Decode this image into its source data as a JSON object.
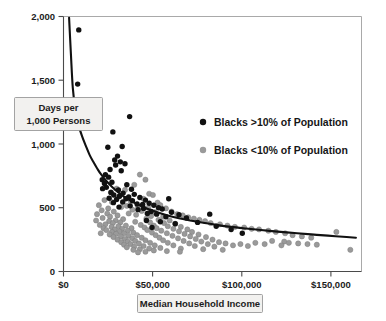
{
  "chart_data": {
    "type": "scatter",
    "title": "",
    "xlabel": "Median Household Income",
    "ylabel": "Days per 1,000 Persons",
    "ylabel_line1": "Days per",
    "ylabel_line2": "1,000 Persons",
    "xlim": [
      0,
      160000
    ],
    "ylim": [
      0,
      2000
    ],
    "grid": false,
    "legend_position": "inside-upper-right",
    "xticks": [
      0,
      50000,
      100000,
      150000
    ],
    "xtick_labels": [
      "$0",
      "$50,000",
      "$100,000",
      "$150,000"
    ],
    "yticks": [
      0,
      500,
      1000,
      1500,
      2000
    ],
    "ytick_labels": [
      "0",
      "500",
      "1,000",
      "1,500",
      "2,000"
    ],
    "colors": {
      "series_black": "#111111",
      "series_gray": "#9a9a9a",
      "curve": "#111111",
      "axis": "#4a4a4a",
      "frame": "#a9a9a9",
      "callout_fill": "#f2f1ef",
      "callout_stroke": "#8d8d8d",
      "background": "#ffffff"
    },
    "series": [
      {
        "name": "Blacks >10% of Population",
        "marker": "filled-circle",
        "color": "#111111",
        "points": [
          [
            8200,
            1895
          ],
          [
            7600,
            1470
          ],
          [
            35500,
            1215
          ],
          [
            26500,
            1095
          ],
          [
            23800,
            975
          ],
          [
            31500,
            980
          ],
          [
            29000,
            905
          ],
          [
            27500,
            875
          ],
          [
            30500,
            860
          ],
          [
            33000,
            845
          ],
          [
            28000,
            835
          ],
          [
            25000,
            800
          ],
          [
            31000,
            790
          ],
          [
            22500,
            760
          ],
          [
            24200,
            740
          ],
          [
            20800,
            720
          ],
          [
            26000,
            700
          ],
          [
            22000,
            690
          ],
          [
            34000,
            680
          ],
          [
            23000,
            660
          ],
          [
            21000,
            650
          ],
          [
            29500,
            640
          ],
          [
            36500,
            645
          ],
          [
            25500,
            620
          ],
          [
            32000,
            615
          ],
          [
            27000,
            600
          ],
          [
            38000,
            605
          ],
          [
            30000,
            590
          ],
          [
            35000,
            585
          ],
          [
            24500,
            575
          ],
          [
            41000,
            580
          ],
          [
            33500,
            570
          ],
          [
            28500,
            565
          ],
          [
            44000,
            560
          ],
          [
            37000,
            555
          ],
          [
            56500,
            570
          ],
          [
            31800,
            545
          ],
          [
            26800,
            540
          ],
          [
            46000,
            535
          ],
          [
            39500,
            530
          ],
          [
            42500,
            525
          ],
          [
            48500,
            520
          ],
          [
            35800,
            515
          ],
          [
            29800,
            505
          ],
          [
            51000,
            500
          ],
          [
            43000,
            495
          ],
          [
            53000,
            490
          ],
          [
            40000,
            485
          ],
          [
            47000,
            470
          ],
          [
            58000,
            465
          ],
          [
            45000,
            455
          ],
          [
            50000,
            450
          ],
          [
            62000,
            445
          ],
          [
            55000,
            430
          ],
          [
            78500,
            450
          ],
          [
            66000,
            420
          ],
          [
            44500,
            400
          ],
          [
            52000,
            390
          ],
          [
            72000,
            385
          ],
          [
            60000,
            375
          ],
          [
            47500,
            345
          ],
          [
            82000,
            355
          ],
          [
            90000,
            330
          ],
          [
            96000,
            300
          ]
        ]
      },
      {
        "name": "Blacks <10% of Population",
        "marker": "filled-circle",
        "color": "#9a9a9a",
        "points": [
          [
            41000,
            760
          ],
          [
            44000,
            720
          ],
          [
            38000,
            680
          ],
          [
            28500,
            650
          ],
          [
            25500,
            620
          ],
          [
            33000,
            640
          ],
          [
            46000,
            610
          ],
          [
            48000,
            600
          ],
          [
            30000,
            590
          ],
          [
            22000,
            560
          ],
          [
            19000,
            520
          ],
          [
            26000,
            545
          ],
          [
            36000,
            555
          ],
          [
            43000,
            570
          ],
          [
            50500,
            540
          ],
          [
            52000,
            520
          ],
          [
            34000,
            515
          ],
          [
            31000,
            505
          ],
          [
            24000,
            495
          ],
          [
            20500,
            480
          ],
          [
            40000,
            510
          ],
          [
            45500,
            500
          ],
          [
            55000,
            495
          ],
          [
            58000,
            470
          ],
          [
            27000,
            470
          ],
          [
            23500,
            455
          ],
          [
            18000,
            450
          ],
          [
            37000,
            485
          ],
          [
            42000,
            475
          ],
          [
            49000,
            465
          ],
          [
            61000,
            450
          ],
          [
            64000,
            440
          ],
          [
            29000,
            440
          ],
          [
            25000,
            430
          ],
          [
            21000,
            420
          ],
          [
            35000,
            455
          ],
          [
            39000,
            445
          ],
          [
            47000,
            435
          ],
          [
            53500,
            430
          ],
          [
            67000,
            425
          ],
          [
            70000,
            415
          ],
          [
            32000,
            410
          ],
          [
            28000,
            400
          ],
          [
            24500,
            395
          ],
          [
            17500,
            400
          ],
          [
            44500,
            415
          ],
          [
            51000,
            405
          ],
          [
            57000,
            400
          ],
          [
            73000,
            405
          ],
          [
            76000,
            395
          ],
          [
            30500,
            385
          ],
          [
            26500,
            380
          ],
          [
            22500,
            370
          ],
          [
            19500,
            365
          ],
          [
            38500,
            390
          ],
          [
            46500,
            385
          ],
          [
            54000,
            380
          ],
          [
            60000,
            375
          ],
          [
            79000,
            380
          ],
          [
            84000,
            370
          ],
          [
            33500,
            360
          ],
          [
            29500,
            355
          ],
          [
            25800,
            350
          ],
          [
            21500,
            340
          ],
          [
            41500,
            365
          ],
          [
            48500,
            360
          ],
          [
            56000,
            355
          ],
          [
            63000,
            350
          ],
          [
            88000,
            360
          ],
          [
            92000,
            350
          ],
          [
            36500,
            340
          ],
          [
            31500,
            335
          ],
          [
            27500,
            330
          ],
          [
            23000,
            325
          ],
          [
            43500,
            345
          ],
          [
            50000,
            340
          ],
          [
            59000,
            335
          ],
          [
            66500,
            330
          ],
          [
            97000,
            345
          ],
          [
            101000,
            335
          ],
          [
            34500,
            320
          ],
          [
            30000,
            315
          ],
          [
            26000,
            310
          ],
          [
            20000,
            300
          ],
          [
            45000,
            325
          ],
          [
            52500,
            320
          ],
          [
            62000,
            315
          ],
          [
            69000,
            310
          ],
          [
            105000,
            330
          ],
          [
            110000,
            320
          ],
          [
            37500,
            305
          ],
          [
            32500,
            300
          ],
          [
            28200,
            295
          ],
          [
            24800,
            290
          ],
          [
            47500,
            305
          ],
          [
            55500,
            300
          ],
          [
            65000,
            295
          ],
          [
            72500,
            290
          ],
          [
            114000,
            310
          ],
          [
            119000,
            300
          ],
          [
            39500,
            285
          ],
          [
            35000,
            280
          ],
          [
            30800,
            275
          ],
          [
            26800,
            270
          ],
          [
            49500,
            285
          ],
          [
            58500,
            280
          ],
          [
            68000,
            275
          ],
          [
            76500,
            270
          ],
          [
            123000,
            285
          ],
          [
            128000,
            275
          ],
          [
            42000,
            265
          ],
          [
            37000,
            260
          ],
          [
            33000,
            255
          ],
          [
            29000,
            250
          ],
          [
            51500,
            265
          ],
          [
            61500,
            260
          ],
          [
            71000,
            255
          ],
          [
            80000,
            250
          ],
          [
            133000,
            265
          ],
          [
            146500,
            310
          ],
          [
            44000,
            245
          ],
          [
            38500,
            240
          ],
          [
            34500,
            235
          ],
          [
            31000,
            230
          ],
          [
            53500,
            245
          ],
          [
            64500,
            240
          ],
          [
            74000,
            235
          ],
          [
            83500,
            230
          ],
          [
            112000,
            240
          ],
          [
            118500,
            235
          ],
          [
            46500,
            225
          ],
          [
            40500,
            220
          ],
          [
            36000,
            215
          ],
          [
            32500,
            210
          ],
          [
            56000,
            225
          ],
          [
            67500,
            220
          ],
          [
            77500,
            215
          ],
          [
            87000,
            220
          ],
          [
            95000,
            215
          ],
          [
            103000,
            225
          ],
          [
            108000,
            215
          ],
          [
            121000,
            225
          ],
          [
            126000,
            220
          ],
          [
            131000,
            215
          ],
          [
            49000,
            205
          ],
          [
            43000,
            200
          ],
          [
            38000,
            195
          ],
          [
            34000,
            190
          ],
          [
            59000,
            205
          ],
          [
            70500,
            200
          ],
          [
            81000,
            195
          ],
          [
            91000,
            205
          ],
          [
            99000,
            200
          ],
          [
            117000,
            205
          ],
          [
            136000,
            210
          ],
          [
            154000,
            170
          ],
          [
            52000,
            185
          ],
          [
            46000,
            180
          ],
          [
            41000,
            175
          ],
          [
            37500,
            170
          ],
          [
            63000,
            180
          ],
          [
            75000,
            175
          ],
          [
            85500,
            170
          ],
          [
            62500,
            155
          ],
          [
            55500,
            160
          ],
          [
            48500,
            165
          ],
          [
            44000,
            155
          ],
          [
            40000,
            150
          ]
        ]
      }
    ],
    "fit_curve": {
      "description": "power-law decay trend line",
      "points": [
        [
          3000,
          1990
        ],
        [
          4000,
          1700
        ],
        [
          5000,
          1440
        ],
        [
          6500,
          1250
        ],
        [
          8000,
          1150
        ],
        [
          10000,
          1060
        ],
        [
          12000,
          985
        ],
        [
          14000,
          915
        ],
        [
          16000,
          860
        ],
        [
          18000,
          810
        ],
        [
          20000,
          765
        ],
        [
          23000,
          710
        ],
        [
          26000,
          665
        ],
        [
          29000,
          625
        ],
        [
          32000,
          592
        ],
        [
          36000,
          556
        ],
        [
          40000,
          525
        ],
        [
          45000,
          492
        ],
        [
          50000,
          466
        ],
        [
          56000,
          440
        ],
        [
          62000,
          418
        ],
        [
          68000,
          400
        ],
        [
          75000,
          382
        ],
        [
          82000,
          366
        ],
        [
          90000,
          350
        ],
        [
          98000,
          337
        ],
        [
          106000,
          325
        ],
        [
          115000,
          313
        ],
        [
          124000,
          302
        ],
        [
          133000,
          291
        ],
        [
          142000,
          281
        ],
        [
          152000,
          270
        ],
        [
          157000,
          265
        ]
      ]
    }
  },
  "chart": {
    "xlabel_box": "Median Household Income",
    "ylabel_box_line1": "Days per",
    "ylabel_box_line2": "1,000 Persons",
    "legend": [
      {
        "label": "Blacks >10% of Population",
        "marker_color": "#111111"
      },
      {
        "label": "Blacks <10% of Population",
        "marker_color": "#9a9a9a"
      }
    ],
    "xtick_labels": [
      "$0",
      "$50,000",
      "$100,000",
      "$150,000"
    ],
    "ytick_labels": [
      "0",
      "500",
      "1,000",
      "1,500",
      "2,000"
    ]
  }
}
